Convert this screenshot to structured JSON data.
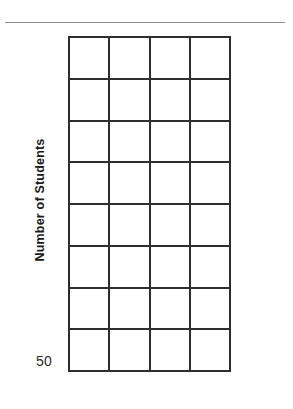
{
  "page": {
    "background_color": "#ffffff",
    "width": 293,
    "height": 409
  },
  "divider": {
    "name": "top-horizontal-rule",
    "color": "#8c8c8c"
  },
  "chart_data": {
    "type": "bar",
    "title": "",
    "subtitle": "",
    "xlabel": "",
    "ylabel": "Number of Students",
    "categories": [
      "",
      "",
      "",
      ""
    ],
    "values": [
      0,
      0,
      0,
      0
    ],
    "series": [],
    "legend": [],
    "legend_position": "none",
    "annotations": [],
    "grid": true,
    "grid_columns": 4,
    "grid_rows": 8,
    "y_tick_labels": [
      "50"
    ],
    "y_baseline_label": "50",
    "x_tick_labels": [],
    "axis_line_color": "#2e2e2e",
    "plot_background_color": "#ffffff",
    "note": "Empty/blank grid template — no bars drawn, all cells are unfilled"
  }
}
